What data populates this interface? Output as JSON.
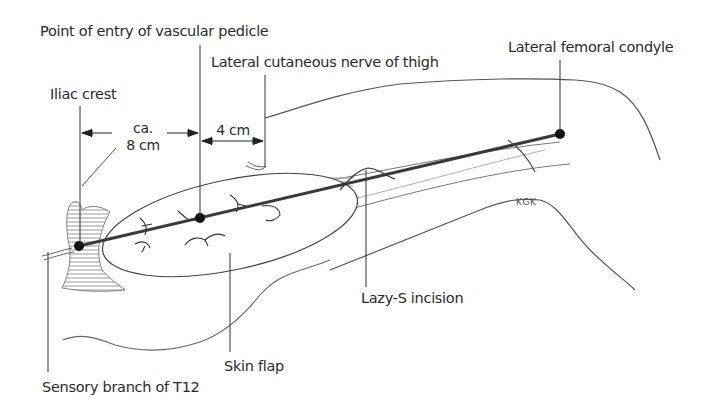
{
  "figure": {
    "type": "surgical anatomy illustration",
    "labels": {
      "pedicle_entry": "Point of entry of vascular pedicle",
      "lateral_cutaneous_nerve": "Lateral cutaneous nerve of thigh",
      "lateral_femoral_condyle": "Lateral femoral condyle",
      "iliac_crest": "Iliac crest",
      "lazy_s_incision": "Lazy-S incision",
      "skin_flap": "Skin flap",
      "sensory_branch_t12": "Sensory branch of T12"
    },
    "dimensions": {
      "iliac_to_pedicle_line1": "ca.",
      "iliac_to_pedicle_line2": "8 cm",
      "pedicle_to_nerve": "4 cm"
    },
    "signature": "KGK",
    "landmarks": [
      {
        "name": "Iliac crest point",
        "x": 79,
        "y": 246
      },
      {
        "name": "Pedicle entry point",
        "x": 200,
        "y": 218
      },
      {
        "name": "Lateral femoral condyle point",
        "x": 560,
        "y": 134
      }
    ],
    "colors": {
      "ink": "#2a2a2a",
      "axis_line": "#3a3a3a",
      "hatch": "#9a9a9a",
      "background": "#ffffff"
    }
  }
}
